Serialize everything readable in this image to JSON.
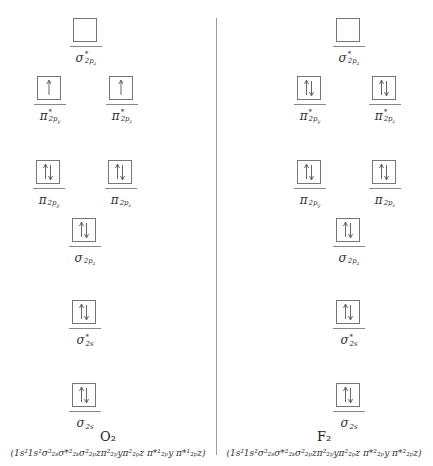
{
  "colors": {
    "line": "#9a9a9a",
    "box_border": "#777777",
    "text": "#333333"
  },
  "panels": [
    {
      "molecule": "O₂",
      "configuration": "(1s²1s²σ²₂ₛσ*²₂ₛσ²₂ₚzπ²₂ₚyπ²₂ₚz π*¹₂ₚy π*¹₂ₚz)",
      "orbitals": [
        {
          "id": "sigma-star-2pz",
          "symbol": "σ",
          "star": true,
          "sub": "2pz",
          "electrons": 0
        },
        {
          "id": "pi-star-2py",
          "symbol": "π",
          "star": true,
          "sub": "2py",
          "electrons": 1
        },
        {
          "id": "pi-star-2pz",
          "symbol": "π",
          "star": true,
          "sub": "2pz",
          "electrons": 1
        },
        {
          "id": "pi-2py",
          "symbol": "π",
          "star": false,
          "sub": "2py",
          "electrons": 2
        },
        {
          "id": "pi-2pz",
          "symbol": "π",
          "star": false,
          "sub": "2pz",
          "electrons": 2
        },
        {
          "id": "sigma-2pz",
          "symbol": "σ",
          "star": false,
          "sub": "2pz",
          "electrons": 2
        },
        {
          "id": "sigma-star-2s",
          "symbol": "σ",
          "star": true,
          "sub": "2s",
          "electrons": 2
        },
        {
          "id": "sigma-2s",
          "symbol": "σ",
          "star": false,
          "sub": "2s",
          "electrons": 2
        }
      ]
    },
    {
      "molecule": "F₂",
      "configuration": "(1s²1s²σ²₂ₛσ*²₂ₛσ²₂ₚzπ²₂ₚyπ²₂ₚz π*²₂ₚy π*²₂ₚz)",
      "orbitals": [
        {
          "id": "sigma-star-2pz",
          "symbol": "σ",
          "star": true,
          "sub": "2pz",
          "electrons": 0
        },
        {
          "id": "pi-star-2py",
          "symbol": "π",
          "star": true,
          "sub": "2py",
          "electrons": 2
        },
        {
          "id": "pi-star-2pz",
          "symbol": "π",
          "star": true,
          "sub": "2pz",
          "electrons": 2
        },
        {
          "id": "pi-2py",
          "symbol": "π",
          "star": false,
          "sub": "2py",
          "electrons": 2
        },
        {
          "id": "pi-2pz",
          "symbol": "π",
          "star": false,
          "sub": "2pz",
          "electrons": 2
        },
        {
          "id": "sigma-2pz",
          "symbol": "σ",
          "star": false,
          "sub": "2pz",
          "electrons": 2
        },
        {
          "id": "sigma-star-2s",
          "symbol": "σ",
          "star": true,
          "sub": "2s",
          "electrons": 2
        },
        {
          "id": "sigma-2s",
          "symbol": "σ",
          "star": false,
          "sub": "2s",
          "electrons": 2
        }
      ]
    }
  ]
}
